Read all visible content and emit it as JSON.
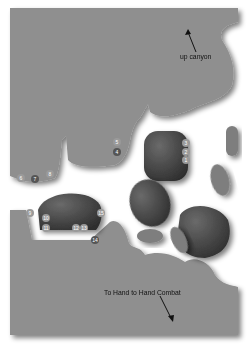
{
  "map": {
    "colors": {
      "ground": "#8f8f8f",
      "background": "#ffffff",
      "boulder_dark": "#4a4a4a",
      "boulder_light": "#7a7a7a",
      "marker": "#9a9a9a",
      "marker_dark": "#555555"
    },
    "labels": {
      "up_canyon": "up canyon",
      "to_combat": "To Hand to Hand Combat"
    },
    "markers": [
      {
        "id": "1",
        "x": 186,
        "y": 160
      },
      {
        "id": "2",
        "x": 186,
        "y": 152
      },
      {
        "id": "3",
        "x": 186,
        "y": 143
      },
      {
        "id": "4",
        "x": 117,
        "y": 152
      },
      {
        "id": "5",
        "x": 117,
        "y": 142
      },
      {
        "id": "6",
        "x": 21,
        "y": 178
      },
      {
        "id": "7",
        "x": 35,
        "y": 179
      },
      {
        "id": "8",
        "x": 50,
        "y": 174
      },
      {
        "id": "9",
        "x": 30,
        "y": 213
      },
      {
        "id": "10",
        "x": 46,
        "y": 218
      },
      {
        "id": "11",
        "x": 46,
        "y": 228
      },
      {
        "id": "12",
        "x": 76,
        "y": 228
      },
      {
        "id": "13",
        "x": 84,
        "y": 228
      },
      {
        "id": "14",
        "x": 95,
        "y": 240
      },
      {
        "id": "15",
        "x": 101,
        "y": 213
      }
    ]
  }
}
